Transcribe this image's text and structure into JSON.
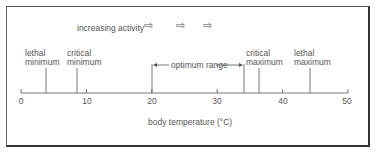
{
  "diagram": {
    "title_hint": "increasing activity",
    "activity_arrows": [
      "arrow-right-icon",
      "arrow-right-icon",
      "arrow-right-icon"
    ],
    "axis": {
      "label": "body temperature (°C)",
      "min": 0,
      "max": 50,
      "ticks": [
        "0",
        "10",
        "20",
        "30",
        "40",
        "50"
      ]
    },
    "markers": [
      {
        "line1": "lethal",
        "line2": "minimum",
        "value": 4
      },
      {
        "line1": "critical",
        "line2": "minimum",
        "value": 8.5
      },
      {
        "line1": "critical",
        "line2": "maximum",
        "value": 36
      },
      {
        "line1": "lethal",
        "line2": "maximum",
        "value": 44
      }
    ],
    "optimum": {
      "label": "optimum range",
      "from": 20,
      "to": 34
    }
  }
}
